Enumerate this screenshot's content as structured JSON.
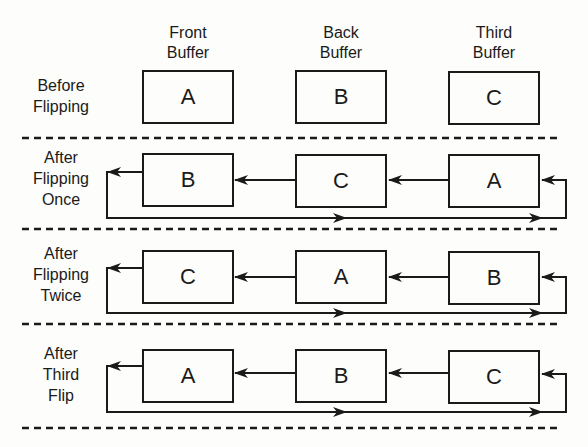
{
  "headers": [
    "Front\nBuffer",
    "Back\nBuffer",
    "Third\nBuffer"
  ],
  "header_lines": [
    [
      "Front",
      "Buffer"
    ],
    [
      "Back",
      "Buffer"
    ],
    [
      "Third",
      "Buffer"
    ]
  ],
  "rows": [
    {
      "label_lines": [
        "Before",
        "Flipping"
      ],
      "buffers": [
        "A",
        "B",
        "C"
      ],
      "has_arrows": false
    },
    {
      "label_lines": [
        "After",
        "Flipping",
        "Once"
      ],
      "buffers": [
        "B",
        "C",
        "A"
      ],
      "has_arrows": true
    },
    {
      "label_lines": [
        "After",
        "Flipping",
        "Twice"
      ],
      "buffers": [
        "C",
        "A",
        "B"
      ],
      "has_arrows": true
    },
    {
      "label_lines": [
        "After",
        "Third",
        "Flip"
      ],
      "buffers": [
        "A",
        "B",
        "C"
      ],
      "has_arrows": true
    }
  ],
  "colors": {
    "ink": "#1a1a1a",
    "background": "#fdfdfb"
  }
}
